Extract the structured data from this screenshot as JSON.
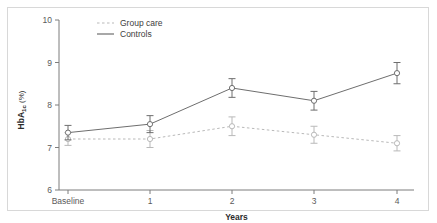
{
  "figure": {
    "frame_color": "#d8d8d8",
    "background": "#ffffff"
  },
  "axes": {
    "y": {
      "title_main": "HbA",
      "title_sub": "1c",
      "title_unit": " (%)",
      "ticks": [
        "10",
        "9",
        "8",
        "7",
        "6"
      ],
      "min": 6,
      "max": 10,
      "axis_color": "#7d7d7d"
    },
    "x": {
      "title": "Years",
      "ticks": [
        "Baseline",
        "1",
        "2",
        "3",
        "4"
      ],
      "axis_color": "#7d7d7d"
    }
  },
  "legend": {
    "position": "top-left-inside",
    "entries": [
      {
        "label": "Group care",
        "style": "dotted",
        "color": "#b9b9b9"
      },
      {
        "label": "Controls",
        "style": "solid",
        "color": "#6e6e6e"
      }
    ]
  },
  "chart_data": {
    "type": "line",
    "title": "",
    "subtitle": "",
    "xlabel": "Years",
    "ylabel": "HbA1c (%)",
    "x": [
      "Baseline",
      "1",
      "2",
      "3",
      "4"
    ],
    "xlim": [
      0,
      4
    ],
    "ylim": [
      6,
      10
    ],
    "yticks": [
      6,
      7,
      8,
      9,
      10
    ],
    "grid": false,
    "legend_position": "upper left",
    "error_bar_type": "symmetric",
    "series": [
      {
        "name": "Controls",
        "style": "solid",
        "color": "#6e6e6e",
        "marker": "open-circle",
        "values": [
          7.35,
          7.55,
          8.4,
          8.1,
          8.75
        ],
        "errors": [
          0.17,
          0.2,
          0.22,
          0.22,
          0.25
        ]
      },
      {
        "name": "Group care",
        "style": "dotted",
        "color": "#b9b9b9",
        "marker": "open-circle",
        "values": [
          7.2,
          7.2,
          7.5,
          7.3,
          7.1
        ],
        "errors": [
          0.15,
          0.2,
          0.22,
          0.2,
          0.18
        ]
      }
    ]
  }
}
